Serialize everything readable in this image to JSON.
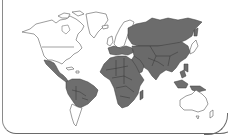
{
  "map": {
    "type": "world-choropleth",
    "legend": null,
    "colors": {
      "shaded": "#707070",
      "unshaded": "#ffffff",
      "outline": "#4a4a4a",
      "frame": "#7a7a7a"
    },
    "regions": [
      {
        "name": "North America",
        "shaded": false
      },
      {
        "name": "Greenland",
        "shaded": false
      },
      {
        "name": "Mexico",
        "shaded": true
      },
      {
        "name": "Central America",
        "shaded": true
      },
      {
        "name": "Caribbean",
        "shaded": false
      },
      {
        "name": "South America (north & central)",
        "shaded": true
      },
      {
        "name": "Southern Cone",
        "shaded": false
      },
      {
        "name": "Northern Europe",
        "shaded": false
      },
      {
        "name": "Southern & Eastern Europe",
        "shaded": true
      },
      {
        "name": "Africa",
        "shaded": true
      },
      {
        "name": "Middle East",
        "shaded": true
      },
      {
        "name": "Russia",
        "shaded": true
      },
      {
        "name": "Central Asia",
        "shaded": true
      },
      {
        "name": "South Asia",
        "shaded": true
      },
      {
        "name": "China",
        "shaded": true
      },
      {
        "name": "Japan",
        "shaded": false
      },
      {
        "name": "Southeast Asia",
        "shaded": true
      },
      {
        "name": "Australia",
        "shaded": false
      },
      {
        "name": "New Zealand",
        "shaded": false
      }
    ]
  }
}
